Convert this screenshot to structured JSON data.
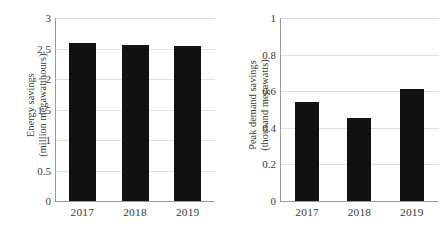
{
  "chart_data": [
    {
      "type": "bar",
      "panel": "left",
      "title": "",
      "ylabel": "Energy savings (million megawatthours)",
      "ylabel_line1": "Energy savings",
      "ylabel_line2": "(million megawatthours)",
      "xlabel": "",
      "categories": [
        "2017",
        "2018",
        "2019"
      ],
      "values": [
        2.59,
        2.56,
        2.54
      ],
      "ylim": [
        0,
        3
      ],
      "yticks": [
        0,
        0.5,
        1,
        1.5,
        2,
        2.5,
        3
      ],
      "ytick_labels": [
        "0",
        "0.5",
        "1",
        "1.5",
        "2",
        "2.5",
        "3"
      ],
      "grid": true,
      "legend": "none",
      "bar_color": "#111111",
      "grid_color": "#e2e2e2",
      "axis_color": "#9a9a9a",
      "text_color": "#3a3a3a"
    },
    {
      "type": "bar",
      "panel": "right",
      "title": "",
      "ylabel": "Peak demand savings (thousand megawatts)",
      "ylabel_line1": "Peak demand savings",
      "ylabel_line2": "(thousand megawatts)",
      "xlabel": "",
      "categories": [
        "2017",
        "2018",
        "2019"
      ],
      "values": [
        0.54,
        0.455,
        0.61
      ],
      "ylim": [
        0,
        1
      ],
      "yticks": [
        0,
        0.2,
        0.4,
        0.6,
        0.8,
        1
      ],
      "ytick_labels": [
        "0",
        "0.2",
        "0.4",
        "0.6",
        "0.8",
        "1"
      ],
      "grid": true,
      "legend": "none",
      "bar_color": "#111111",
      "grid_color": "#e2e2e2",
      "axis_color": "#9a9a9a",
      "text_color": "#3a3a3a"
    }
  ]
}
